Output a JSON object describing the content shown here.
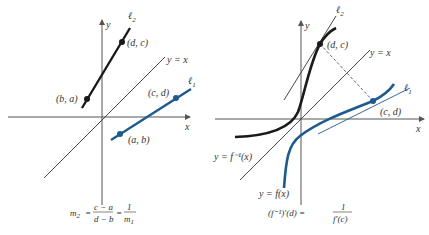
{
  "colors": {
    "axis": "#555555",
    "black_line": "#1a1a1a",
    "blue_line": "#1d5a8e",
    "text": "#333333"
  },
  "left_panel": {
    "axis_labels": {
      "x": "x",
      "y": "y"
    },
    "line_yx_label": "y = x",
    "line1_label": "ℓ",
    "line1_sub": "1",
    "line2_label": "ℓ",
    "line2_sub": "2",
    "points": {
      "dc": "(d, c)",
      "ba": "(b, a)",
      "cd": "(c, d)",
      "ab": "(a, b)"
    },
    "formula": {
      "lhs": "m",
      "lhs_sub": "2",
      "eq": "=",
      "num": "c − a",
      "den": "d − b",
      "eq2": "=",
      "num2": "1",
      "den2": "m",
      "den2_sub": "1"
    }
  },
  "right_panel": {
    "axis_labels": {
      "x": "x",
      "y": "y"
    },
    "line_yx_label": "y = x",
    "line1_label": "ℓ",
    "line1_sub": "1",
    "line2_label": "ℓ",
    "line2_sub": "2",
    "points": {
      "dc": "(d, c)",
      "cd": "(c, d)"
    },
    "curve_inverse_label": "y = f⁻¹(x)",
    "curve_f_label": "y = f(x)",
    "formula": {
      "lhs": "(f⁻¹)′(d) =",
      "num": "1",
      "den": "f′(c)"
    }
  }
}
